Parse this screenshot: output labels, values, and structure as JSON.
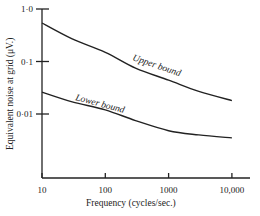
{
  "chart_data": {
    "type": "line",
    "title": "",
    "xlabel": "Frequency (cycles/sec.)",
    "ylabel": "Equivalent noise at grid (μV.)",
    "xscale": "log",
    "yscale": "log",
    "xlim": [
      10,
      10000
    ],
    "ylim": [
      0.001,
      1.0
    ],
    "x_ticks": [
      {
        "value": 10,
        "label": "10"
      },
      {
        "value": 100,
        "label": "100"
      },
      {
        "value": 1000,
        "label": "1000"
      },
      {
        "value": 10000,
        "label": "10,000"
      }
    ],
    "y_ticks": [
      {
        "value": 1.0,
        "label": "1·0"
      },
      {
        "value": 0.1,
        "label": "0·1"
      },
      {
        "value": 0.01,
        "label": "0·01"
      }
    ],
    "grid": false,
    "legend": "none",
    "series": [
      {
        "name": "Upper bound",
        "x": [
          10,
          30,
          100,
          300,
          1000,
          3000,
          10000
        ],
        "values": [
          0.54,
          0.27,
          0.15,
          0.075,
          0.044,
          0.027,
          0.018
        ]
      },
      {
        "name": "Lower bound",
        "x": [
          10,
          30,
          100,
          300,
          1000,
          3000,
          10000
        ],
        "values": [
          0.026,
          0.017,
          0.012,
          0.0075,
          0.0048,
          0.004,
          0.0035
        ]
      }
    ],
    "annotations": [
      {
        "text": "Upper bound",
        "series": 0
      },
      {
        "text": "Lower bound",
        "series": 1
      }
    ]
  }
}
